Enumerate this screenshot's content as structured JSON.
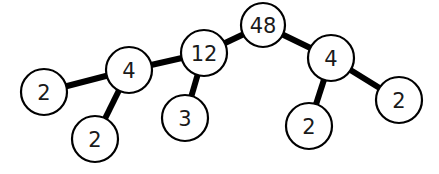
{
  "diagram": {
    "type": "factor-tree",
    "colors": {
      "stroke": "#000000",
      "fill": "#ffffff",
      "text": "#1a1a1a"
    },
    "nodes": [
      {
        "id": "n48",
        "label": "48",
        "x": 263,
        "y": 25,
        "r": 22
      },
      {
        "id": "n12",
        "label": "12",
        "x": 204,
        "y": 53,
        "r": 23
      },
      {
        "id": "n4a",
        "label": "4",
        "x": 129,
        "y": 70,
        "r": 23
      },
      {
        "id": "n2a",
        "label": "2",
        "x": 44,
        "y": 92,
        "r": 23
      },
      {
        "id": "n2b",
        "label": "2",
        "x": 95,
        "y": 139,
        "r": 23
      },
      {
        "id": "n3",
        "label": "3",
        "x": 185,
        "y": 118,
        "r": 23
      },
      {
        "id": "n4b",
        "label": "4",
        "x": 331,
        "y": 58,
        "r": 23
      },
      {
        "id": "n2c",
        "label": "2",
        "x": 309,
        "y": 126,
        "r": 23
      },
      {
        "id": "n2d",
        "label": "2",
        "x": 399,
        "y": 100,
        "r": 23
      }
    ],
    "edges": [
      {
        "from": "n48",
        "to": "n12"
      },
      {
        "from": "n48",
        "to": "n4b"
      },
      {
        "from": "n12",
        "to": "n4a"
      },
      {
        "from": "n12",
        "to": "n3"
      },
      {
        "from": "n4a",
        "to": "n2a"
      },
      {
        "from": "n4a",
        "to": "n2b"
      },
      {
        "from": "n4b",
        "to": "n2c"
      },
      {
        "from": "n4b",
        "to": "n2d"
      }
    ]
  }
}
